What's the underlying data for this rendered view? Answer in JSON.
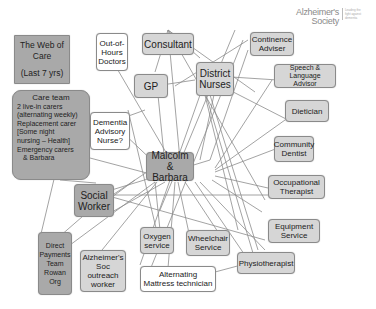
{
  "title": {
    "line1": "The Web of Care",
    "line2": "(Last 7 yrs)"
  },
  "logo": {
    "line1": "Alzheimer's",
    "line2": "Society",
    "tagline": "Leading the fight against dementia"
  },
  "center": {
    "label": "Malcolm & Barbara"
  },
  "care_team": {
    "heading": "Care team",
    "lines": [
      "2 live-in carers",
      "(alternating weekly)",
      "Replacement carer",
      "[Some night",
      "nursing – Health]",
      "Emergency carers",
      "& Barbara"
    ]
  },
  "nodes": [
    {
      "id": "out-of-hours-doctors",
      "label": "Out-of-Hours Doctors"
    },
    {
      "id": "consultant",
      "label": "Consultant"
    },
    {
      "id": "gp",
      "label": "GP"
    },
    {
      "id": "district-nurses",
      "label": "District Nurses"
    },
    {
      "id": "continence-adviser",
      "label": "Continence Adviser"
    },
    {
      "id": "speech-language-advisor",
      "label": "Speech & Language Advisor"
    },
    {
      "id": "dietician",
      "label": "Dietician"
    },
    {
      "id": "community-dentist",
      "label": "Community Dentist"
    },
    {
      "id": "occupational-therapist",
      "label": "Occupational Therapist"
    },
    {
      "id": "equipment-service",
      "label": "Equipment Service"
    },
    {
      "id": "physiotherapist",
      "label": "Physiotherapist"
    },
    {
      "id": "wheelchair-service",
      "label": "Wheelchair Service"
    },
    {
      "id": "alternating-mattress-technician",
      "label": "Alternating Mattress technician"
    },
    {
      "id": "oxygen-service",
      "label": "Oxygen service"
    },
    {
      "id": "alzheimers-soc-outreach-worker",
      "label": "Alzheimer's Soc outreach worker"
    },
    {
      "id": "direct-payments-team",
      "label": "Direct Payments Team Rowan Org"
    },
    {
      "id": "social-worker",
      "label": "Social Worker"
    },
    {
      "id": "dementia-advisory-nurse",
      "label": "Dementia Advisory Nurse?"
    }
  ],
  "edges": [
    [
      174,
      166,
      112,
      60
    ],
    [
      180,
      160,
      168,
      30
    ],
    [
      165,
      165,
      158,
      95
    ],
    [
      200,
      160,
      215,
      90
    ],
    [
      210,
      160,
      248,
      50
    ],
    [
      215,
      168,
      272,
      80
    ],
    [
      215,
      170,
      292,
      115
    ],
    [
      215,
      172,
      278,
      148
    ],
    [
      215,
      176,
      268,
      188
    ],
    [
      212,
      180,
      262,
      212
    ],
    [
      200,
      182,
      265,
      250
    ],
    [
      195,
      182,
      255,
      270
    ],
    [
      185,
      182,
      218,
      232
    ],
    [
      178,
      182,
      190,
      238
    ],
    [
      165,
      182,
      112,
      212
    ],
    [
      160,
      168,
      120,
      130
    ],
    [
      158,
      176,
      90,
      158
    ],
    [
      150,
      170,
      105,
      200
    ],
    [
      155,
      182,
      70,
      245
    ],
    [
      157,
      182,
      98,
      255
    ],
    [
      155,
      182,
      160,
      230
    ],
    [
      175,
      182,
      168,
      268
    ],
    [
      168,
      30,
      155,
      72
    ],
    [
      168,
      30,
      200,
      58
    ],
    [
      168,
      30,
      255,
      92
    ],
    [
      168,
      30,
      265,
      200
    ],
    [
      155,
      86,
      195,
      80
    ],
    [
      175,
      86,
      248,
      40
    ],
    [
      200,
      75,
      278,
      80
    ],
    [
      200,
      75,
      288,
      120
    ],
    [
      200,
      75,
      238,
      230
    ],
    [
      200,
      75,
      258,
      270
    ],
    [
      200,
      95,
      140,
      265
    ],
    [
      210,
      95,
      258,
      250
    ],
    [
      243,
      40,
      150,
      270
    ],
    [
      235,
      30,
      160,
      210
    ],
    [
      105,
      195,
      268,
      195
    ],
    [
      105,
      195,
      265,
      240
    ],
    [
      105,
      192,
      210,
      160
    ],
    [
      108,
      200,
      135,
      180
    ],
    [
      55,
      175,
      40,
      238
    ],
    [
      90,
      210,
      52,
      243
    ],
    [
      60,
      180,
      96,
      183
    ],
    [
      128,
      110,
      160,
      245
    ],
    [
      90,
      130,
      145,
      110
    ],
    [
      185,
      280,
      260,
      260
    ]
  ]
}
